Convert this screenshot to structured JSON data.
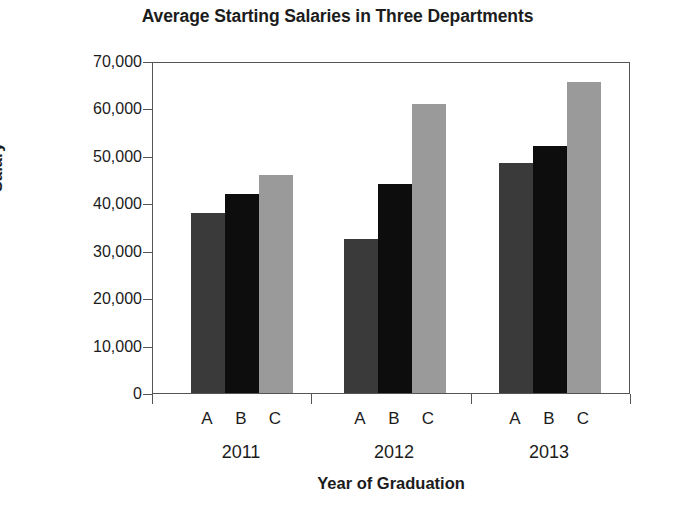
{
  "chart_data": {
    "type": "bar",
    "title": "Average Starting Salaries in Three Departments",
    "xlabel": "Year of Graduation",
    "ylabel": "Salary",
    "categories": [
      "2011",
      "2012",
      "2013"
    ],
    "series": [
      {
        "name": "A",
        "label": "A",
        "color": "#3a3a3a",
        "values": [
          38000,
          32500,
          48500
        ]
      },
      {
        "name": "B",
        "label": "B",
        "color": "#0d0d0d",
        "values": [
          42000,
          44000,
          52000
        ]
      },
      {
        "name": "C",
        "label": "C",
        "color": "#9a9a9a",
        "values": [
          46000,
          61000,
          65500
        ]
      }
    ],
    "ylim": [
      0,
      70000
    ],
    "ytick_values": [
      0,
      10000,
      20000,
      30000,
      40000,
      50000,
      60000,
      70000
    ],
    "ytick_labels": [
      "0",
      "10,000",
      "20,000",
      "30,000",
      "40,000",
      "50,000",
      "60,000",
      "70,000"
    ],
    "grid": false,
    "legend": "none",
    "frame": true,
    "group_tick_count": 4
  }
}
